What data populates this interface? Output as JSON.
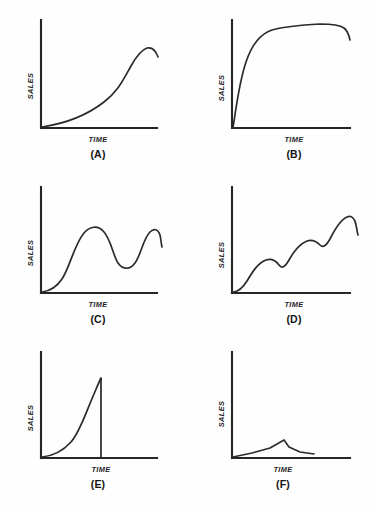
{
  "figure": {
    "background_color": "#fefefe",
    "line_color": "#2b2b2b",
    "axis_color": "#262626",
    "panel_count": 6
  },
  "axis_labels": {
    "y": "SALES",
    "x": "TIME"
  },
  "panels": [
    {
      "id": "A",
      "caption": "(A)",
      "ylabel": "SALES",
      "xlabel": "TIME",
      "pattern": "slow gradual growth then steep acceleration to a peak with slight final decline",
      "axis": {
        "x0": 41,
        "y0": 128,
        "x1": 157,
        "ytop": 20
      },
      "curve": "M 42 127 C 62 124, 86 116, 104 102 C 118 91, 122 82, 131 66 C 136 57, 141 50, 147 48 C 152 47, 156 51, 158 57",
      "drop": ""
    },
    {
      "id": "B",
      "caption": "(B)",
      "ylabel": "SALES",
      "xlabel": "TIME",
      "pattern": "very rapid rise from origin, sharp knee, long high plateau, slight dip at the end",
      "axis": {
        "x0": 42,
        "y0": 128,
        "x1": 160,
        "ytop": 20
      },
      "curve": "M 43 127 C 45 118, 48 86, 56 62 C 62 44, 70 34, 82 30 C 96 26, 112 25, 130 24 C 142 24, 150 25, 154 28 C 158 31, 159 36, 160 40",
      "drop": ""
    },
    {
      "id": "C",
      "caption": "(C)",
      "ylabel": "SALES",
      "xlabel": "TIME",
      "pattern": "cyclical wave: rise to first peak, dip to mid-level trough, rise to second peak, final decline",
      "axis": {
        "x0": 41,
        "y0": 118,
        "x1": 157,
        "ytop": 12
      },
      "curve": "M 42 117 C 50 116, 56 113, 62 104 C 70 92, 74 70, 84 58 C 90 51, 98 50, 104 57 C 111 65, 113 80, 118 88 C 123 95, 130 95, 135 88 C 141 80, 143 64, 150 57 C 154 53, 158 54, 160 60 C 161 64, 161 68, 162 72",
      "drop": ""
    },
    {
      "id": "D",
      "caption": "(D)",
      "ylabel": "SALES",
      "xlabel": "TIME",
      "pattern": "scalloped growth: successive rises separated by short plateaus, ending at a peak with small decline",
      "axis": {
        "x0": 42,
        "y0": 118,
        "x1": 160,
        "ytop": 12
      },
      "curve": "M 43 117 C 48 117, 52 114, 57 106 C 63 96, 68 88, 76 85 C 82 83, 86 86, 89 90 C 92 94, 95 92, 99 85 C 104 76, 109 69, 117 66 C 123 64, 127 67, 130 70 C 133 73, 136 71, 140 64 C 145 54, 150 45, 157 42 C 162 40, 165 44, 166 50 C 167 54, 167 57, 168 60",
      "drop": ""
    },
    {
      "id": "E",
      "caption": "(E)",
      "ylabel": "SALES",
      "xlabel": "TIME",
      "pattern": "fad: exponential rise to a sharp peak followed by an immediate vertical collapse to zero",
      "axis": {
        "x0": 41,
        "y0": 118,
        "x1": 157,
        "ytop": 12
      },
      "curve": "M 42 117 C 52 116, 62 112, 71 102 C 80 92, 86 72, 94 54 C 97 47, 99 42, 101 38",
      "drop": "M 101 38 L 101 118"
    },
    {
      "id": "F",
      "caption": "(F)",
      "ylabel": "SALES",
      "xlabel": "TIME",
      "pattern": "failure: very low shallow rise to a small peak then decline back toward the axis",
      "axis": {
        "x0": 42,
        "y0": 118,
        "x1": 160,
        "ytop": 12
      },
      "curve": "M 43 117 L 62 113 L 80 108 L 94 100 L 99 107 L 110 112 L 124 114",
      "drop": ""
    }
  ]
}
